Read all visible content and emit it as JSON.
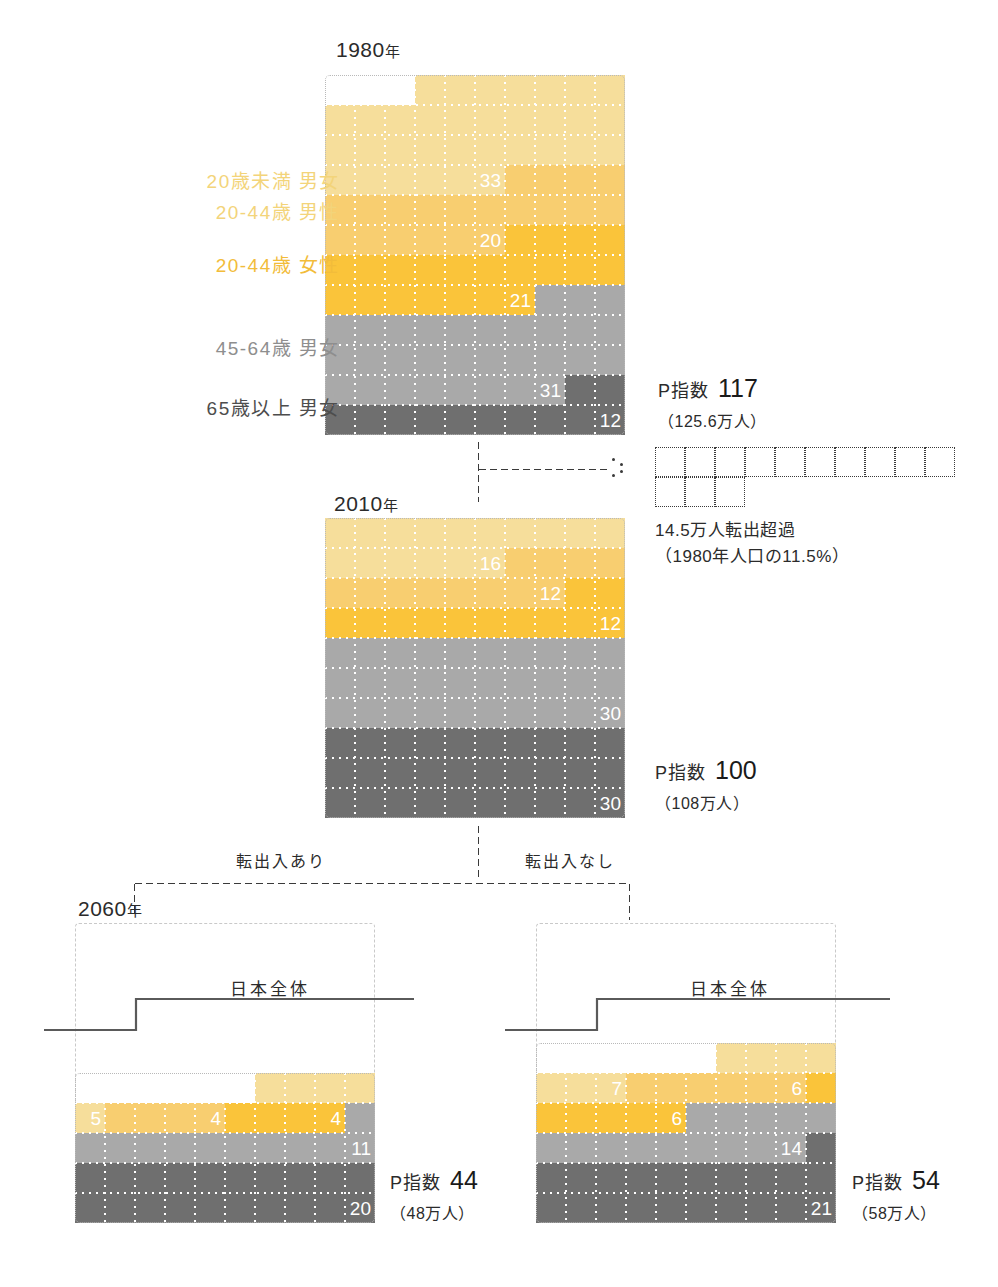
{
  "legend": [
    {
      "label": "20歳未満 男女",
      "color": "#F6DE9B",
      "key": "under20"
    },
    {
      "label": "20-44歳 男性",
      "color": "#F8CE70",
      "key": "m2044"
    },
    {
      "label": "20-44歳 女性",
      "color": "#FAC43A",
      "key": "f2044"
    },
    {
      "label": "45-64歳 男女",
      "color": "#A9A9A9",
      "key": "a4564"
    },
    {
      "label": "65歳以上 男女",
      "color": "#6F6F6F",
      "key": "over65"
    }
  ],
  "panels": {
    "y1980": {
      "year": "1980",
      "year_suffix": "年",
      "pindex_label": "P指数",
      "pindex_value": "117",
      "population": "（125.6万人）"
    },
    "y2010": {
      "year": "2010",
      "year_suffix": "年",
      "pindex_label": "P指数",
      "pindex_value": "100",
      "population": "（108万人）"
    },
    "y2060_left": {
      "year": "2060",
      "year_suffix": "年",
      "branch_label": "転出入あり",
      "japan_line_label": "日本全体",
      "pindex_label": "P指数",
      "pindex_value": "44",
      "population": "（48万人）"
    },
    "y2060_right": {
      "branch_label": "転出入なし",
      "japan_line_label": "日本全体",
      "pindex_label": "P指数",
      "pindex_value": "54",
      "population": "（58万人）"
    }
  },
  "outflow_note": {
    "line1": "14.5万人転出超過",
    "line2": "（1980年人口の11.5%）",
    "cells_row1": 10,
    "cells_row2": 3
  },
  "chart_data": {
    "type": "bar",
    "xlabel": "",
    "ylabel": "人口（1セル = 1単位、100 = 2010年基準）",
    "categories": [
      "20歳未満 男女",
      "20-44歳 男性",
      "20-44歳 女性",
      "45-64歳 男女",
      "65歳以上 男女"
    ],
    "series": [
      {
        "name": "1980年",
        "p_index": 117,
        "population_man": 125.6,
        "values": [
          33,
          20,
          21,
          31,
          12
        ],
        "total": 117
      },
      {
        "name": "2010年",
        "p_index": 100,
        "population_man": 108,
        "values": [
          16,
          12,
          12,
          30,
          30
        ],
        "total": 100
      },
      {
        "name": "2060年 転出入あり",
        "p_index": 44,
        "population_man": 48,
        "values": [
          5,
          4,
          4,
          11,
          20
        ],
        "total": 44
      },
      {
        "name": "2060年 転出入なし",
        "p_index": 54,
        "population_man": 58,
        "values": [
          7,
          6,
          6,
          14,
          21
        ],
        "total": 54
      }
    ],
    "colors": [
      "#F6DE9B",
      "#F8CE70",
      "#FAC43A",
      "#A9A9A9",
      "#6F6F6F"
    ],
    "annotations": [
      {
        "text": "14.5万人転出超過（1980年人口の11.5%）",
        "value": 14.5,
        "percent": 11.5
      },
      {
        "text": "日本全体",
        "note": "2060年パネルの全国平均を示す階段線"
      }
    ],
    "grid": true,
    "legend_position": "left",
    "unit_cells_per_row": 10
  }
}
